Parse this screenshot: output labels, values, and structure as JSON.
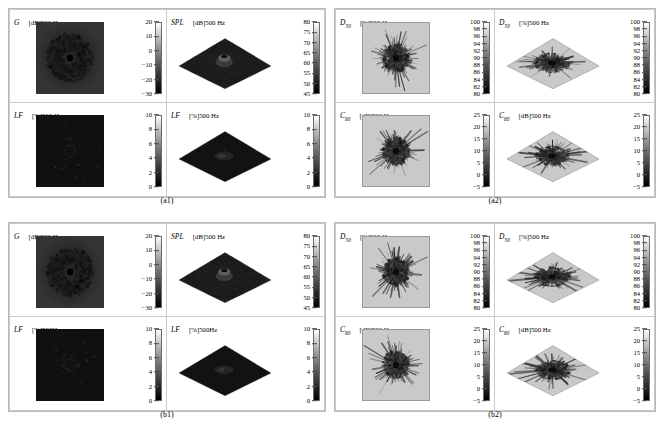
{
  "figure": {
    "colorbar_style": "grayscale-white-to-black",
    "accent": "#151515"
  },
  "quadrants": [
    {
      "id": "a1",
      "caption": "(a1)",
      "panels": [
        {
          "name": "g-2d",
          "symbol": "G",
          "sub": "",
          "unit": "[dB]500 Hz",
          "view": "2d",
          "shade": "dark",
          "cbar": {
            "ticks": [
              "20",
              "10",
              "0",
              "−10",
              "−20",
              "−30"
            ],
            "min": -30,
            "max": 20,
            "step": 10,
            "unit": "dB"
          }
        },
        {
          "name": "spl-3d",
          "symbol": "SPL",
          "sub": "",
          "unit": "[dB]500 Hz",
          "view": "3d",
          "shade": "dark",
          "cbar": {
            "ticks": [
              "80",
              "75",
              "70",
              "65",
              "60",
              "55",
              "50",
              "45"
            ],
            "min": 45,
            "max": 80,
            "step": 5,
            "unit": "dB"
          }
        },
        {
          "name": "lf-2d",
          "symbol": "LF",
          "sub": "",
          "unit": "[%]500 Hz",
          "view": "2d",
          "shade": "dark",
          "cbar": {
            "ticks": [
              "10",
              "8",
              "6",
              "4",
              "2",
              "0"
            ],
            "min": 0,
            "max": 10,
            "step": 2,
            "unit": "%"
          }
        },
        {
          "name": "lf-3d",
          "symbol": "LF",
          "sub": "",
          "unit": "[%]500 Hz",
          "view": "3d",
          "shade": "dark",
          "cbar": {
            "ticks": [
              "10",
              "8",
              "6",
              "4",
              "2",
              "0"
            ],
            "min": 0,
            "max": 10,
            "step": 2,
            "unit": "%"
          }
        }
      ]
    },
    {
      "id": "a2",
      "caption": "(a2)",
      "panels": [
        {
          "name": "d50-2d",
          "symbol": "D",
          "sub": "50",
          "unit": "[%]500 Hz",
          "view": "2d",
          "shade": "light",
          "cbar": {
            "ticks": [
              "100",
              "98",
              "96",
              "94",
              "92",
              "90",
              "88",
              "86",
              "84",
              "82",
              "80"
            ],
            "min": 80,
            "max": 100,
            "step": 2,
            "unit": "%"
          }
        },
        {
          "name": "d50-3d",
          "symbol": "D",
          "sub": "50",
          "unit": "[%]500 Hz",
          "view": "3d",
          "shade": "light",
          "cbar": {
            "ticks": [
              "100",
              "98",
              "96",
              "94",
              "92",
              "90",
              "88",
              "86",
              "84",
              "82",
              "80"
            ],
            "min": 80,
            "max": 100,
            "step": 2,
            "unit": "%"
          }
        },
        {
          "name": "c80-2d",
          "symbol": "C",
          "sub": "80",
          "unit": "[dB]500 Hz",
          "view": "2d",
          "shade": "light",
          "cbar": {
            "ticks": [
              "25",
              "20",
              "15",
              "10",
              "5",
              "0",
              "−5"
            ],
            "min": -5,
            "max": 25,
            "step": 5,
            "unit": "dB"
          }
        },
        {
          "name": "c80-3d",
          "symbol": "C",
          "sub": "80",
          "unit": "[dB]500 Hz",
          "view": "3d",
          "shade": "light",
          "cbar": {
            "ticks": [
              "25",
              "20",
              "15",
              "10",
              "5",
              "0",
              "−5"
            ],
            "min": -5,
            "max": 25,
            "step": 5,
            "unit": "dB"
          }
        }
      ]
    },
    {
      "id": "b1",
      "caption": "(b1)",
      "panels": [
        {
          "name": "g-2d",
          "symbol": "G",
          "sub": "",
          "unit": "[dB]500 Hz",
          "view": "2d",
          "shade": "dark",
          "cbar": {
            "ticks": [
              "20",
              "10",
              "0",
              "−10",
              "−20",
              "−30"
            ],
            "min": -30,
            "max": 20,
            "step": 10,
            "unit": "dB"
          }
        },
        {
          "name": "spl-3d",
          "symbol": "SPL",
          "sub": "",
          "unit": "[dB]500 Hz",
          "view": "3d",
          "shade": "dark",
          "cbar": {
            "ticks": [
              "80",
              "75",
              "70",
              "65",
              "60",
              "55",
              "50",
              "45"
            ],
            "min": 45,
            "max": 80,
            "step": 5,
            "unit": "dB"
          }
        },
        {
          "name": "lf-2d",
          "symbol": "LF",
          "sub": "",
          "unit": "[%]500Hz",
          "view": "2d",
          "shade": "dark",
          "cbar": {
            "ticks": [
              "10",
              "8",
              "6",
              "4",
              "2",
              "0"
            ],
            "min": 0,
            "max": 10,
            "step": 2,
            "unit": "%"
          }
        },
        {
          "name": "lf-3d",
          "symbol": "LF",
          "sub": "",
          "unit": "[%]500Hz",
          "view": "3d",
          "shade": "dark",
          "cbar": {
            "ticks": [
              "10",
              "8",
              "6",
              "4",
              "2",
              "0"
            ],
            "min": 0,
            "max": 10,
            "step": 2,
            "unit": "%"
          }
        }
      ]
    },
    {
      "id": "b2",
      "caption": "(b2)",
      "panels": [
        {
          "name": "d50-2d",
          "symbol": "D",
          "sub": "50",
          "unit": "[%]500 Hz",
          "view": "2d",
          "shade": "light",
          "cbar": {
            "ticks": [
              "100",
              "98",
              "96",
              "94",
              "92",
              "90",
              "88",
              "86",
              "84",
              "82",
              "80"
            ],
            "min": 80,
            "max": 100,
            "step": 2,
            "unit": "%"
          }
        },
        {
          "name": "d50-3d",
          "symbol": "D",
          "sub": "50",
          "unit": "[%]500 Hz",
          "view": "3d",
          "shade": "light",
          "cbar": {
            "ticks": [
              "100",
              "98",
              "96",
              "94",
              "92",
              "90",
              "88",
              "86",
              "84",
              "82",
              "80"
            ],
            "min": 80,
            "max": 100,
            "step": 2,
            "unit": "%"
          }
        },
        {
          "name": "c80-2d",
          "symbol": "C",
          "sub": "80",
          "unit": "[dB]500 Hz",
          "view": "2d",
          "shade": "light",
          "cbar": {
            "ticks": [
              "25",
              "20",
              "15",
              "10",
              "5",
              "0",
              "−5"
            ],
            "min": -5,
            "max": 25,
            "step": 5,
            "unit": "dB"
          }
        },
        {
          "name": "c80-3d",
          "symbol": "C",
          "sub": "80",
          "unit": "[dB]500 Hz",
          "view": "3d",
          "shade": "light",
          "cbar": {
            "ticks": [
              "25",
              "20",
              "15",
              "10",
              "5",
              "0",
              "−5"
            ],
            "min": -5,
            "max": 25,
            "step": 5,
            "unit": "dB"
          }
        }
      ]
    }
  ]
}
